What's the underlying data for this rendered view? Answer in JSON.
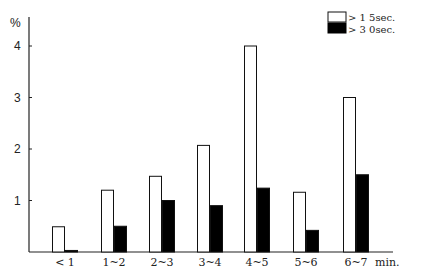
{
  "chart_data": {
    "type": "bar",
    "title": "",
    "xlabel": "min.",
    "ylabel": "%",
    "ylim": [
      0,
      4.3
    ],
    "yticks": [
      1,
      2,
      3,
      4
    ],
    "grid": false,
    "legend_position": "top-right",
    "categories": [
      "< 1",
      "1~2",
      "2~3",
      "3~4",
      "4~5",
      "5~6",
      "6~7"
    ],
    "series": [
      {
        "name": "> 1 5sec.",
        "color": "#ffffff",
        "values": [
          0.49,
          1.2,
          1.47,
          2.07,
          4.0,
          1.16,
          3.0
        ]
      },
      {
        "name": "> 3 0sec.",
        "color": "#000000",
        "values": [
          0.03,
          0.5,
          1.0,
          0.9,
          1.24,
          0.42,
          1.5
        ]
      }
    ]
  }
}
